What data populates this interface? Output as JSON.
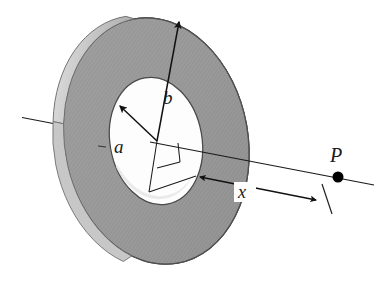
{
  "figure": {
    "type": "physics-diagram",
    "background_color": "#ffffff",
    "labels": {
      "inner_radius": "a",
      "outer_radius": "b",
      "axial_distance": "x",
      "field_point": "P"
    },
    "colors": {
      "ring_face": "#9b9b9b",
      "ring_face_dark": "#8a8a8a",
      "ring_rim_highlight": "#d8d8d8",
      "ring_edge_light": "#c9c9c9",
      "inner_wall": "#b0b0b0",
      "hole_fill": "#fdfdfd",
      "outline": "#3a3a3a",
      "line": "#1a1a1a",
      "point": "#000000"
    },
    "geometry": {
      "center_x": 156,
      "center_y": 141,
      "outer_rx": 92,
      "outer_ry": 124,
      "inner_rx": 46,
      "inner_ry": 64,
      "tilt_degrees": -10,
      "axis_left_x": 22,
      "axis_left_y": 117,
      "axis_right_x": 374,
      "axis_right_y": 185,
      "point_p_x": 338,
      "point_p_y": 177,
      "point_p_radius": 5.5
    },
    "annotations": [
      {
        "name": "radius-a-arrow",
        "label": "a",
        "from": [
          156,
          141
        ],
        "to": [
          118,
          104
        ],
        "label_pos": [
          119,
          146
        ]
      },
      {
        "name": "radius-b-arrow",
        "label": "b",
        "from": [
          156,
          141
        ],
        "to": [
          178,
          20
        ],
        "label_pos": [
          166,
          98
        ]
      },
      {
        "name": "distance-x-dimension",
        "label": "x",
        "from": [
          196,
          176
        ],
        "to": [
          318,
          200
        ],
        "label_pos": [
          244,
          196
        ]
      },
      {
        "name": "point-p-label",
        "label": "P",
        "label_pos": [
          337,
          162
        ]
      }
    ]
  }
}
